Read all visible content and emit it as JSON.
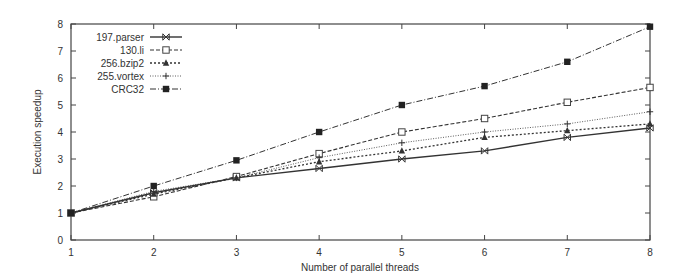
{
  "chart_data": {
    "type": "line",
    "title": "",
    "xlabel": "Number of parallel threads",
    "ylabel": "Execution speedup",
    "x": [
      1,
      2,
      3,
      4,
      5,
      6,
      7,
      8
    ],
    "xlim": [
      1,
      8
    ],
    "ylim": [
      0,
      8
    ],
    "xticks": [
      "1",
      "2",
      "3",
      "4",
      "5",
      "6",
      "7",
      "8"
    ],
    "yticks": [
      "0",
      "1",
      "2",
      "3",
      "4",
      "5",
      "6",
      "7",
      "8"
    ],
    "grid": false,
    "legend_position": "top-left",
    "series": [
      {
        "name": "197.parser",
        "marker": "x-bar",
        "dash": "solid",
        "values": [
          1.0,
          1.75,
          2.3,
          2.65,
          3.0,
          3.3,
          3.8,
          4.15
        ]
      },
      {
        "name": "130.li",
        "marker": "open-square",
        "dash": "dashed",
        "values": [
          1.0,
          1.6,
          2.35,
          3.2,
          4.0,
          4.5,
          5.1,
          5.65
        ]
      },
      {
        "name": "256.bzip2",
        "marker": "triangle",
        "dash": "dotted",
        "values": [
          1.0,
          1.7,
          2.3,
          2.9,
          3.3,
          3.8,
          4.05,
          4.3
        ]
      },
      {
        "name": "255.vortex",
        "marker": "plus",
        "dash": "fine-dotted",
        "values": [
          1.0,
          1.8,
          2.3,
          3.05,
          3.6,
          4.0,
          4.3,
          4.75
        ]
      },
      {
        "name": "CRC32",
        "marker": "filled-square",
        "dash": "dash-dot",
        "values": [
          1.0,
          2.0,
          2.95,
          4.0,
          5.0,
          5.7,
          6.6,
          7.9
        ]
      }
    ]
  }
}
